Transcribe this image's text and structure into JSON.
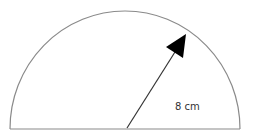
{
  "diagram": {
    "shape": "semicircle",
    "radius_label": "8 cm",
    "colors": {
      "outline": "#8a8a8a",
      "arrow": "#000000",
      "label": "#333333",
      "background": "#ffffff"
    }
  }
}
